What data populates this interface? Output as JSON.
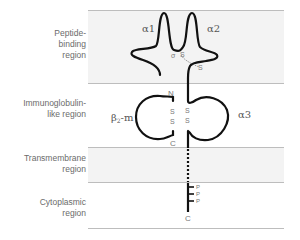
{
  "regions": [
    {
      "id": "peptide-binding",
      "label": "Peptide-\nbinding\nregion",
      "shaded": true
    },
    {
      "id": "immunoglobulin-like",
      "label": "Immunoglobulin-\nlike region",
      "shaded": false
    },
    {
      "id": "transmembrane",
      "label": "Transmembrane\nregion",
      "shaded": true
    },
    {
      "id": "cytoplasmic",
      "label": "Cytoplasmic\nregion",
      "shaded": false
    }
  ],
  "domains": {
    "alpha1": "α1",
    "alpha2": "α2",
    "alpha3": "α3",
    "beta2m": "β2-m",
    "beta2m_base": "β",
    "beta2m_sub": "2",
    "beta2m_suffix": "-m"
  },
  "termini": {
    "beta2m_n": "N",
    "beta2m_c": "C",
    "heavy_c": "C"
  },
  "disulfide": {
    "s": "S"
  },
  "phosphates": [
    "P",
    "P",
    "P"
  ],
  "colors": {
    "band": "#f2f2f2",
    "line": "#bdbdbd",
    "chain": "#111111",
    "text": "#6b6b6b"
  }
}
